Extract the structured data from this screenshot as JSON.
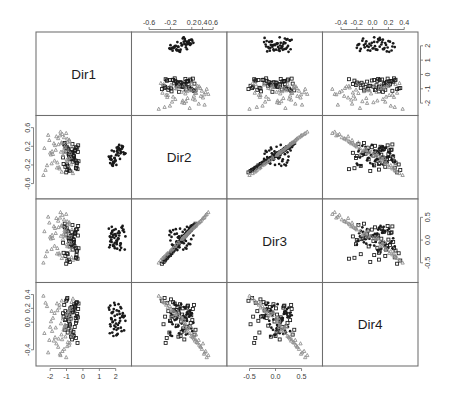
{
  "figure": {
    "type": "scatterplot-matrix",
    "title": "",
    "n_vars": 4,
    "variables": [
      "Dir1",
      "Dir2",
      "Dir3",
      "Dir4"
    ],
    "background_color": "#ffffff",
    "panel_border_color": "#6e6e6e",
    "grid": {
      "left": 36,
      "top": 32,
      "right": 418,
      "bottom": 366,
      "panel_width": 95.5,
      "panel_height": 83.5
    }
  },
  "diagonal_labels": [
    {
      "var": "Dir1",
      "label": "Dir1",
      "row": 0,
      "col": 0
    },
    {
      "var": "Dir2",
      "label": "Dir2",
      "row": 1,
      "col": 1
    },
    {
      "var": "Dir3",
      "label": "Dir3",
      "row": 2,
      "col": 2
    },
    {
      "var": "Dir4",
      "label": "Dir4",
      "row": 3,
      "col": 3
    }
  ],
  "axes": [
    {
      "name": "top-col2",
      "side": "top",
      "var": "Dir2",
      "index": 1,
      "ticks": [
        -0.6,
        -0.2,
        0.2,
        0.4,
        0.6
      ],
      "tick_labels": [
        "-0.6",
        "-0.2",
        "0.2",
        "0.4",
        "0.6"
      ]
    },
    {
      "name": "top-col4",
      "side": "top",
      "var": "Dir4",
      "index": 3,
      "ticks": [
        -0.4,
        -0.2,
        0.0,
        0.2,
        0.4
      ],
      "tick_labels": [
        "-0.4",
        "-0.2",
        "0.0",
        "0.2",
        "0.4"
      ]
    },
    {
      "name": "bottom-col1",
      "side": "bottom",
      "var": "Dir1",
      "index": 0,
      "ticks": [
        -2,
        -1,
        0,
        1,
        2
      ],
      "tick_labels": [
        "-2",
        "-1",
        "0",
        "1",
        "2"
      ]
    },
    {
      "name": "bottom-col3",
      "side": "bottom",
      "var": "Dir3",
      "index": 2,
      "ticks": [
        -0.5,
        0.0,
        0.5
      ],
      "tick_labels": [
        "-0.5",
        "0.0",
        "0.5"
      ]
    },
    {
      "name": "left-row2",
      "side": "left",
      "var": "Dir2",
      "index": 1,
      "ticks": [
        0.6,
        0.2,
        -0.2,
        -0.6
      ],
      "tick_labels": [
        "0.6",
        "0.2",
        "-0.2",
        "-0.6"
      ]
    },
    {
      "name": "left-row4",
      "side": "left",
      "var": "Dir4",
      "index": 3,
      "ticks": [
        0.4,
        0.2,
        0.0,
        -0.4
      ],
      "tick_labels": [
        "0.4",
        "0.2",
        "0.0",
        "-0.4"
      ]
    },
    {
      "name": "right-row1",
      "side": "right",
      "var": "Dir1",
      "index": 0,
      "ticks": [
        2,
        1,
        0,
        -1,
        -2
      ],
      "tick_labels": [
        "2",
        "1",
        "0",
        "-1",
        "-2"
      ]
    },
    {
      "name": "right-row3",
      "side": "right",
      "var": "Dir3",
      "index": 2,
      "ticks": [
        0.5,
        0.0,
        -0.5
      ],
      "tick_labels": [
        "0.5",
        "0.0",
        "-0.5"
      ]
    }
  ],
  "groups": [
    {
      "name": "group-1",
      "marker": "filled-circle",
      "color": "#1a1a1a",
      "count": 50
    },
    {
      "name": "group-2",
      "marker": "open-square",
      "color": "#1a1a1a",
      "count": 50
    },
    {
      "name": "group-3",
      "marker": "open-triangle",
      "color": "#8e8e8e",
      "count": 50
    }
  ],
  "chart_data": {
    "type": "scatter",
    "title": "",
    "subtitle": "",
    "xlabel": "",
    "ylabel": "",
    "grid": false,
    "legend_position": "none",
    "variables": [
      "Dir1",
      "Dir2",
      "Dir3",
      "Dir4"
    ],
    "axis_ranges": {
      "Dir1": [
        -2.6,
        2.7
      ],
      "Dir2": [
        -0.85,
        0.78
      ],
      "Dir3": [
        -0.85,
        0.82
      ],
      "Dir4": [
        -0.58,
        0.52
      ]
    },
    "series": [
      {
        "name": "group-1",
        "marker": "filled-circle",
        "color": "#1a1a1a",
        "Dir1": [
          1.72,
          2.05,
          1.88,
          2.27,
          1.64,
          2.42,
          1.95,
          2.13,
          1.77,
          2.31,
          1.58,
          2.08,
          1.83,
          2.55,
          1.69,
          2.19,
          1.91,
          2.36,
          1.75,
          2.02,
          2.24,
          1.86,
          2.47,
          1.61,
          2.15,
          1.97,
          2.29,
          1.79,
          2.09,
          1.92,
          2.38,
          1.67,
          2.21,
          1.84,
          2.51,
          1.73,
          2.06,
          1.99,
          2.33,
          1.81,
          2.12,
          1.94,
          2.43,
          1.66,
          2.17,
          1.89,
          2.26,
          1.76,
          2.04,
          2.59
        ],
        "Dir2": [
          -0.08,
          0.02,
          -0.15,
          0.11,
          -0.04,
          0.18,
          -0.11,
          0.06,
          -0.19,
          0.14,
          -0.02,
          0.09,
          -0.22,
          0.04,
          -0.06,
          0.16,
          -0.13,
          0.21,
          -0.09,
          0.01,
          0.12,
          -0.17,
          0.07,
          -0.03,
          0.19,
          -0.12,
          0.05,
          -0.21,
          0.1,
          -0.05,
          0.15,
          -0.08,
          0.23,
          -0.14,
          0.03,
          -0.01,
          0.17,
          -0.1,
          0.08,
          -0.18,
          0.13,
          -0.06,
          0.2,
          -0.16,
          0.0,
          0.09,
          -0.07,
          0.11,
          -0.2,
          0.05
        ],
        "Dir3": [
          0.14,
          -0.05,
          0.22,
          -0.12,
          0.08,
          0.31,
          -0.18,
          0.03,
          0.17,
          -0.08,
          0.25,
          -0.02,
          0.11,
          -0.21,
          0.06,
          0.19,
          -0.14,
          0.28,
          -0.04,
          0.09,
          0.16,
          -0.1,
          0.23,
          -0.16,
          0.02,
          0.13,
          -0.07,
          0.2,
          -0.19,
          0.05,
          0.27,
          -0.03,
          0.1,
          -0.13,
          0.18,
          0.01,
          -0.09,
          0.24,
          -0.17,
          0.07,
          0.15,
          -0.06,
          0.21,
          -0.11,
          0.04,
          0.12,
          -0.22,
          0.29,
          -0.01,
          0.08
        ],
        "Dir4": [
          0.06,
          -0.11,
          0.19,
          0.02,
          -0.16,
          0.1,
          0.25,
          -0.04,
          0.13,
          -0.08,
          0.21,
          -0.18,
          0.01,
          0.09,
          -0.06,
          0.16,
          0.28,
          -0.13,
          0.04,
          -0.02,
          0.12,
          -0.2,
          0.07,
          0.18,
          -0.09,
          0.03,
          0.22,
          -0.15,
          0.11,
          -0.05,
          0.08,
          0.24,
          -0.01,
          0.15,
          -0.12,
          0.05,
          0.17,
          -0.07,
          0.2,
          0.0,
          -0.17,
          0.09,
          0.13,
          -0.03,
          0.26,
          -0.1,
          0.06,
          0.14,
          -0.19,
          0.02
        ]
      },
      {
        "name": "group-2",
        "marker": "open-square",
        "color": "#1a1a1a",
        "Dir1": [
          -0.62,
          -0.88,
          -0.41,
          -1.05,
          -0.73,
          -0.35,
          -0.95,
          -0.58,
          -1.18,
          -0.47,
          -0.81,
          -0.29,
          -1.02,
          -0.66,
          -0.39,
          -0.91,
          -0.54,
          -1.11,
          -0.44,
          -0.77,
          -0.33,
          -0.99,
          -0.69,
          -0.5,
          -1.07,
          -0.85,
          -0.37,
          -0.64,
          -1.21,
          -0.46,
          -0.79,
          -0.31,
          -0.97,
          -0.71,
          -0.52,
          -1.09,
          -0.43,
          -0.83,
          -0.27,
          -1.0,
          -0.6,
          -0.48,
          -0.93,
          -0.75,
          -0.38,
          -1.14,
          -0.56,
          -0.68,
          -0.86,
          -0.42
        ],
        "Dir2": [
          -0.13,
          0.04,
          -0.26,
          0.09,
          -0.05,
          0.17,
          -0.31,
          0.01,
          -0.18,
          0.12,
          -0.08,
          0.22,
          -0.36,
          0.06,
          -0.21,
          0.15,
          -0.02,
          0.27,
          -0.11,
          0.03,
          -0.29,
          0.19,
          -0.07,
          0.1,
          -0.24,
          0.0,
          -0.15,
          0.25,
          -0.04,
          0.13,
          -0.33,
          0.08,
          -0.19,
          0.05,
          -0.09,
          0.21,
          -0.27,
          0.02,
          -0.12,
          0.16,
          -0.06,
          0.11,
          -0.22,
          0.07,
          -0.16,
          0.24,
          -0.01,
          0.14,
          -0.3,
          0.18
        ],
        "Dir3": [
          -0.21,
          0.05,
          -0.38,
          0.12,
          -0.09,
          0.24,
          -0.45,
          0.02,
          -0.28,
          0.16,
          -0.14,
          0.31,
          -0.52,
          0.08,
          -0.33,
          0.19,
          -0.04,
          0.36,
          -0.17,
          0.01,
          -0.41,
          0.26,
          -0.11,
          0.13,
          -0.35,
          -0.02,
          -0.23,
          0.33,
          -0.06,
          0.17,
          -0.48,
          0.1,
          -0.29,
          0.04,
          -0.13,
          0.28,
          -0.39,
          0.03,
          -0.18,
          0.21,
          -0.08,
          0.15,
          -0.31,
          0.09,
          -0.25,
          0.3,
          0.0,
          0.18,
          -0.43,
          0.23
        ],
        "Dir4": [
          0.17,
          -0.09,
          0.28,
          0.04,
          -0.21,
          0.12,
          0.35,
          -0.14,
          0.08,
          0.23,
          -0.05,
          0.19,
          0.31,
          -0.25,
          0.02,
          0.14,
          0.26,
          -0.11,
          0.06,
          0.2,
          -0.3,
          0.1,
          0.22,
          -0.07,
          0.16,
          0.01,
          0.29,
          -0.18,
          0.13,
          0.24,
          -0.03,
          0.07,
          0.33,
          -0.12,
          0.18,
          0.03,
          -0.23,
          0.11,
          0.27,
          -0.06,
          0.15,
          0.21,
          -0.15,
          0.05,
          0.09,
          0.25,
          -0.2,
          0.14,
          0.08,
          -0.01
        ]
      },
      {
        "name": "group-3",
        "marker": "open-triangle",
        "color": "#8e8e8e",
        "Dir1": [
          -1.31,
          -0.95,
          -1.62,
          -0.78,
          -1.45,
          -2.05,
          -1.12,
          -0.61,
          -1.88,
          -1.25,
          -0.88,
          -1.7,
          -2.28,
          -1.04,
          -1.51,
          -0.72,
          -1.95,
          -1.37,
          -0.99,
          -1.77,
          -2.41,
          -1.18,
          -0.84,
          -1.56,
          -1.09,
          -2.12,
          -1.43,
          -0.67,
          -1.83,
          -1.29,
          -0.92,
          -1.66,
          -2.19,
          -1.15,
          -0.75,
          -1.49,
          -1.02,
          -1.91,
          -1.34,
          -0.81,
          -1.58,
          -2.35,
          -1.22,
          -0.96,
          -1.73,
          -1.07,
          -1.4,
          -0.69,
          -2.0,
          -1.27
        ],
        "Dir2": [
          0.28,
          -0.12,
          0.41,
          0.05,
          -0.25,
          0.33,
          0.18,
          -0.38,
          0.09,
          0.46,
          -0.06,
          0.22,
          -0.31,
          0.14,
          0.37,
          -0.19,
          0.02,
          0.51,
          -0.09,
          0.26,
          -0.42,
          0.11,
          0.34,
          -0.15,
          0.07,
          0.44,
          -0.28,
          0.19,
          0.03,
          -0.35,
          0.29,
          0.12,
          -0.21,
          0.39,
          -0.04,
          0.24,
          0.48,
          -0.17,
          0.08,
          0.31,
          -0.26,
          0.16,
          0.01,
          0.36,
          -0.11,
          0.21,
          0.43,
          -0.33,
          0.06,
          0.27
        ],
        "Dir3": [
          0.32,
          -0.14,
          0.48,
          0.07,
          -0.29,
          0.38,
          0.21,
          -0.44,
          0.11,
          0.55,
          -0.05,
          0.26,
          -0.36,
          0.17,
          0.42,
          -0.22,
          0.03,
          0.61,
          -0.1,
          0.3,
          -0.5,
          0.13,
          0.39,
          -0.18,
          0.08,
          0.51,
          -0.32,
          0.23,
          0.04,
          -0.4,
          0.34,
          0.15,
          -0.25,
          0.45,
          -0.06,
          0.28,
          0.57,
          -0.2,
          0.09,
          0.36,
          -0.3,
          0.19,
          0.02,
          0.41,
          -0.13,
          0.25,
          0.49,
          -0.38,
          0.07,
          0.31
        ],
        "Dir4": [
          -0.18,
          0.09,
          -0.31,
          0.03,
          0.21,
          -0.26,
          -0.06,
          0.34,
          -0.13,
          -0.42,
          0.15,
          -0.22,
          0.28,
          -0.09,
          -0.36,
          0.19,
          0.01,
          -0.48,
          0.12,
          -0.27,
          0.38,
          -0.11,
          -0.33,
          0.17,
          -0.04,
          -0.44,
          0.25,
          -0.2,
          0.06,
          0.31,
          -0.29,
          -0.08,
          0.23,
          -0.39,
          0.1,
          -0.24,
          -0.51,
          0.16,
          -0.02,
          -0.3,
          0.27,
          -0.16,
          0.05,
          -0.35,
          0.13,
          -0.21,
          -0.46,
          0.29,
          -0.07,
          -0.25
        ]
      }
    ]
  }
}
